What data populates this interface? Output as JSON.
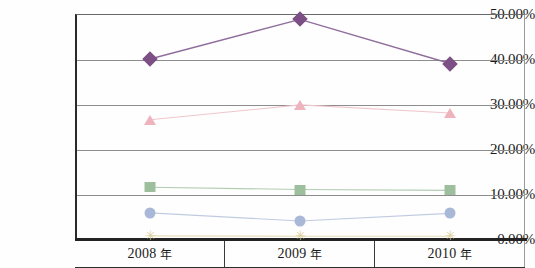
{
  "chart_data": {
    "type": "line",
    "title": "",
    "subtitle": "",
    "xlabel": "",
    "ylabel": "",
    "categories": [
      "2008 年",
      "2009 年",
      "2010 年"
    ],
    "category_years": [
      "2008",
      "2009",
      "2010"
    ],
    "category_unit": "年",
    "ylim": [
      0,
      50
    ],
    "ytick_labels": [
      "0.00%",
      "10.00%",
      "20.00%",
      "30.00%",
      "40.00%",
      "50.00%"
    ],
    "ytick_values": [
      0,
      10,
      20,
      30,
      40,
      50
    ],
    "ytick_format": "percent",
    "grid": "horizontal",
    "legend": "none",
    "series": [
      {
        "name": "series-1",
        "marker": "diamond",
        "color": "#7c4f85",
        "line_color": "#8f6d9b",
        "values": [
          40.0,
          48.8,
          39.0
        ],
        "value_labels": [
          "40.00%",
          "48.80%",
          "39.00%"
        ]
      },
      {
        "name": "series-2",
        "marker": "triangle",
        "color": "#eeb3bd",
        "line_color": "#f0c6cd",
        "values": [
          26.5,
          29.8,
          28.0
        ],
        "value_labels": [
          "26.50%",
          "29.80%",
          "28.00%"
        ]
      },
      {
        "name": "series-3",
        "marker": "square",
        "color": "#9dbf9d",
        "line_color": "#b3cdb3",
        "values": [
          11.5,
          11.0,
          10.8
        ],
        "value_labels": [
          "11.50%",
          "11.00%",
          "10.80%"
        ]
      },
      {
        "name": "series-4",
        "marker": "circle",
        "color": "#aab8d8",
        "line_color": "#c0cbe2",
        "values": [
          5.8,
          4.0,
          5.7
        ],
        "value_labels": [
          "5.80%",
          "4.00%",
          "5.70%"
        ]
      },
      {
        "name": "series-5",
        "marker": "star",
        "color": "#ddcf9a",
        "line_color": "#e6dcb6",
        "values": [
          0.7,
          0.6,
          0.6
        ],
        "value_labels": [
          "0.70%",
          "0.60%",
          "0.60%"
        ]
      }
    ]
  },
  "axes": {
    "y_labels": [
      "50.00%",
      "40.00%",
      "30.00%",
      "20.00%",
      "10.00%",
      "0.00%"
    ],
    "x_labels": [
      "2008 年",
      "2009 年",
      "2010 年"
    ]
  }
}
